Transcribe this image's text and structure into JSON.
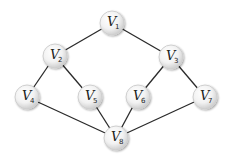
{
  "diagram": {
    "type": "graph",
    "nodes": [
      {
        "id": "V1",
        "letter": "V",
        "sub": "1",
        "x": 112,
        "y": 23
      },
      {
        "id": "V2",
        "letter": "V",
        "sub": "2",
        "x": 55,
        "y": 56
      },
      {
        "id": "V3",
        "letter": "V",
        "sub": "3",
        "x": 171,
        "y": 57
      },
      {
        "id": "V4",
        "letter": "V",
        "sub": "4",
        "x": 27,
        "y": 97
      },
      {
        "id": "V5",
        "letter": "V",
        "sub": "5",
        "x": 90,
        "y": 97
      },
      {
        "id": "V6",
        "letter": "V",
        "sub": "6",
        "x": 138,
        "y": 97
      },
      {
        "id": "V7",
        "letter": "V",
        "sub": "7",
        "x": 205,
        "y": 97
      },
      {
        "id": "V8",
        "letter": "V",
        "sub": "8",
        "x": 116,
        "y": 138
      }
    ],
    "edges": [
      [
        "V1",
        "V2"
      ],
      [
        "V1",
        "V3"
      ],
      [
        "V2",
        "V4"
      ],
      [
        "V2",
        "V5"
      ],
      [
        "V3",
        "V6"
      ],
      [
        "V3",
        "V7"
      ],
      [
        "V4",
        "V8"
      ],
      [
        "V5",
        "V8"
      ],
      [
        "V6",
        "V8"
      ],
      [
        "V7",
        "V8"
      ]
    ],
    "node_radius": 12,
    "colors": {
      "edge": "#2a2a2a",
      "node_fill_center": "#ffffff",
      "node_fill_edge": "#d9d9d9",
      "text": "#222222"
    }
  }
}
